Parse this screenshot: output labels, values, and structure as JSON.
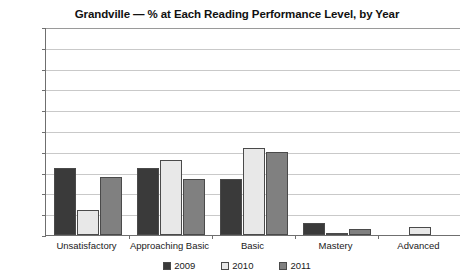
{
  "chart_data": {
    "type": "bar",
    "title": "Grandville — % at Each Reading Performance Level, by Year",
    "xlabel": "",
    "ylabel": "",
    "ylim": [
      0,
      100
    ],
    "yticks": [
      0,
      10,
      20,
      30,
      40,
      50,
      60,
      70,
      80,
      90,
      100
    ],
    "grid": true,
    "legend_position": "bottom",
    "categories": [
      "Unsatisfactory",
      "Approaching Basic",
      "Basic",
      "Mastery",
      "Advanced"
    ],
    "series": [
      {
        "name": "2009",
        "color": "#3a3a3a",
        "values": [
          32,
          32,
          27,
          6,
          0
        ]
      },
      {
        "name": "2010",
        "color": "#e8e8e8",
        "values": [
          12,
          36,
          42,
          1,
          4
        ]
      },
      {
        "name": "2011",
        "color": "#808080",
        "values": [
          28,
          27,
          40,
          3,
          0
        ]
      }
    ]
  },
  "axis": {
    "y_tick_labels": [
      "100",
      "90",
      "80",
      "70",
      "60",
      "50",
      "40",
      "30",
      "20",
      "10",
      "0"
    ]
  },
  "legend": {
    "entries": [
      {
        "label": "2009"
      },
      {
        "label": "2010"
      },
      {
        "label": "2011"
      }
    ]
  },
  "cropped_top_text": ""
}
